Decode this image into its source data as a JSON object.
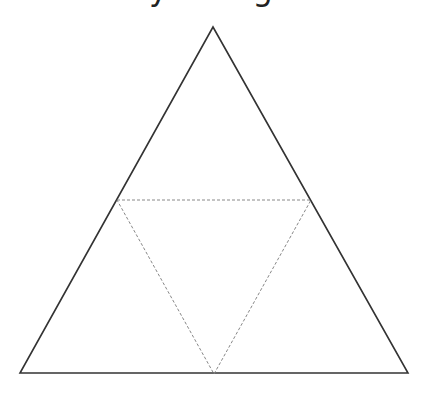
{
  "diagram": {
    "title": "by triangle",
    "outer_triangle": {
      "points": [
        [
          213,
          27
        ],
        [
          20,
          373
        ],
        [
          408,
          373
        ]
      ],
      "stroke": "#333333",
      "style": "solid"
    },
    "inner_triangle": {
      "points": [
        [
          117,
          200
        ],
        [
          311,
          200
        ],
        [
          214,
          374
        ]
      ],
      "stroke": "#888888",
      "style": "dashed"
    }
  }
}
